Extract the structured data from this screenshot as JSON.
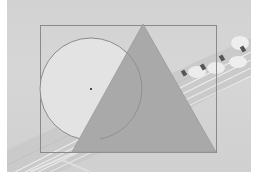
{
  "scene": {
    "description": "Grayscale photo of guitar headstock and strings with geometric overlay shapes",
    "background_color": "#ffffff",
    "photo_tone": "#d3d3d3"
  },
  "shapes": {
    "rectangle": {
      "x": 40,
      "y": 25,
      "width": 176,
      "height": 127,
      "stroke": "#8a8a8a",
      "fill": "none"
    },
    "circle": {
      "cx": 91,
      "cy": 89,
      "r": 51,
      "stroke": "#8c8c8c",
      "fill": "#e3e3e3"
    },
    "center_point": {
      "x": 91,
      "y": 89,
      "color": "#4a4a4a"
    },
    "triangle": {
      "points": [
        [
          143,
          24
        ],
        [
          72,
          152
        ],
        [
          216,
          152
        ]
      ],
      "fill": "#a9a9a9",
      "stroke": "#999999"
    }
  },
  "photo_elements": {
    "tuning_pegs": [
      {
        "x": 184,
        "y": 72
      },
      {
        "x": 203,
        "y": 66
      },
      {
        "x": 222,
        "y": 57
      },
      {
        "x": 243,
        "y": 48
      }
    ],
    "peg_buttons": [
      {
        "cx": 197,
        "cy": 72,
        "rx": 9,
        "ry": 6
      },
      {
        "cx": 216,
        "cy": 68,
        "rx": 9,
        "ry": 6
      },
      {
        "cx": 238,
        "cy": 62,
        "rx": 9,
        "ry": 6
      },
      {
        "cx": 240,
        "cy": 43,
        "rx": 9,
        "ry": 7
      }
    ]
  }
}
